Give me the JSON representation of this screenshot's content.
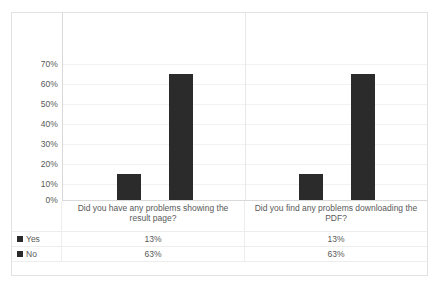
{
  "chart_data": {
    "type": "bar",
    "title": "",
    "xlabel": "",
    "ylabel": "",
    "ylim": [
      0,
      70
    ],
    "grid": true,
    "legend_position": "table-left",
    "y_tick_labels": [
      "70%",
      "60%",
      "50%",
      "40%",
      "30%",
      "20%",
      "10%",
      "0%"
    ],
    "y_tick_values": [
      70,
      60,
      50,
      40,
      30,
      20,
      10,
      0
    ],
    "categories": [
      "Did you have any problems showing the result page?",
      "Did you find any problems downloading the PDF?"
    ],
    "series": [
      {
        "name": "Yes",
        "values": [
          13,
          13
        ],
        "labels": [
          "13%",
          "13%"
        ],
        "color": "#2b2b2b"
      },
      {
        "name": "No",
        "values": [
          63,
          63
        ],
        "labels": [
          "63%",
          "63%"
        ],
        "color": "#2b2b2b"
      }
    ]
  },
  "table": {
    "legend_header": "",
    "rows": [
      {
        "label": "Yes",
        "cells": [
          "13%",
          "13%"
        ]
      },
      {
        "label": "No",
        "cells": [
          "63%",
          "63%"
        ]
      }
    ]
  },
  "colors": {
    "bar": "#2b2b2b",
    "border": "#e2e2e2",
    "gridline": "#f2f2f2",
    "axis": "#d9d9d9",
    "text": "#595959"
  }
}
